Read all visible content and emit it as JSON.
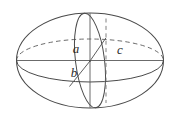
{
  "figure": {
    "kind": "geometric-solid-diagram",
    "background_color": "#ffffff",
    "stroke_color": "#4a4a4a",
    "label_color": "#2b2b2b",
    "labels": {
      "a": "a",
      "b": "b",
      "c": "c"
    },
    "label_positions": {
      "a": {
        "x": 76,
        "y": 53
      },
      "b": {
        "x": 74,
        "y": 77
      },
      "c": {
        "x": 120,
        "y": 54
      }
    },
    "geometry": {
      "center": {
        "x": 90,
        "y": 61
      },
      "outline_ellipse": {
        "cx": 90,
        "cy": 60.5,
        "rx": 73.5,
        "ry": 47.5
      },
      "equator_ellipse": {
        "cx": 90,
        "cy": 60.5,
        "rx": 73.5,
        "ry": 21.5
      },
      "meridian_ellipse": {
        "cx": 90,
        "cy": 60.5,
        "rx": 14.5,
        "ry": 47.5,
        "rotation_deg": -7
      },
      "vertical_axis": {
        "x1": 90,
        "y1": 13,
        "x2": 90,
        "y2": 108
      },
      "horizontal_axis": {
        "x1": 17,
        "y1": 60.5,
        "x2": 163,
        "y2": 60.5
      },
      "dashed_vertical_line": {
        "x1": 106,
        "y1": 18,
        "x2": 106,
        "y2": 103
      },
      "radius_c_line": {
        "x1": 90,
        "y1": 61,
        "x2": 106,
        "y2": 38
      },
      "radius_b_line": {
        "x1": 90,
        "y1": 61,
        "x2": 70,
        "y2": 86
      }
    },
    "line_styles": {
      "solid": "front / visible edges",
      "dashed": "hidden / rear edges"
    }
  }
}
